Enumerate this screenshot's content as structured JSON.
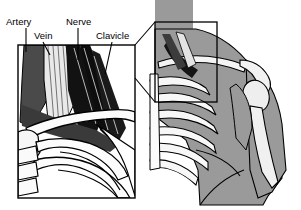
{
  "figure": {
    "background_color": "#ffffff",
    "labels": [
      {
        "id": "artery",
        "text": "Artery",
        "x": 6,
        "y": 25,
        "icon": "leader-line-icon"
      },
      {
        "id": "vein",
        "text": "Vein",
        "x": 34,
        "y": 39,
        "icon": "leader-line-icon"
      },
      {
        "id": "nerve",
        "text": "Nerve",
        "x": 66,
        "y": 25,
        "icon": "leader-line-icon"
      },
      {
        "id": "clavicle",
        "text": "Clavicle",
        "x": 96,
        "y": 39,
        "icon": "leader-line-icon"
      }
    ],
    "leader_lines": [
      {
        "id": "artery-leader",
        "points": "26,28 26,52"
      },
      {
        "id": "vein-leader",
        "points": "43,42 50,55"
      },
      {
        "id": "nerve-leader",
        "points": "78,28 78,60"
      },
      {
        "id": "clavicle-leader",
        "points": "112,42 105,74"
      }
    ],
    "main_inset": {
      "name": "magnified-neurovascular-view",
      "frame": {
        "x": 18,
        "y": 45,
        "width": 117,
        "height": 153
      },
      "stroke_color": "#000000"
    },
    "body_view": {
      "name": "shoulder-thorax-overview",
      "silhouette_color": "#9a9a9a",
      "bone_color": "#f2f2f2",
      "stroke_color": "#000000",
      "neck_block": {
        "x": 155,
        "y": 0,
        "width": 38,
        "height": 28
      }
    },
    "magnifier_box": {
      "name": "magnifier-region-box",
      "frame": {
        "x": 155,
        "y": 22,
        "width": 62,
        "height": 80
      }
    },
    "connector_lines": [
      {
        "id": "connector-top",
        "points": "155,22 135,45"
      },
      {
        "id": "connector-bottom",
        "points": "155,102 135,78"
      }
    ],
    "palette": {
      "artery_dark": "#4a4a4a",
      "vein_light": "#e8e8e8",
      "nerve_black": "#111111",
      "bone_white": "#fbfbfb",
      "muscle_gray": "#8f8f8f",
      "silhouette_gray": "#9a9a9a",
      "outline": "#000000"
    }
  }
}
